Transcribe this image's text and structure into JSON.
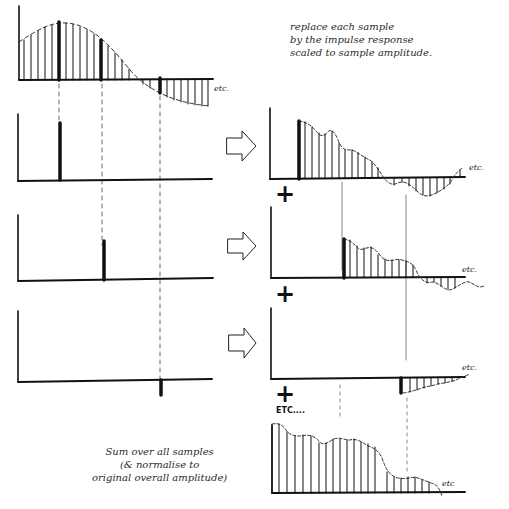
{
  "notes": {
    "top": [
      "replace each sample",
      "by the impulse response",
      "scaled to sample amplitude."
    ],
    "bottom": [
      "Sum over all samples",
      "(& normalise to",
      "original overall amplitude)"
    ]
  },
  "labels": {
    "etc": "etc.",
    "etc_sum": "etc",
    "etc_more": "ETC....",
    "plus": "+"
  },
  "panels": [
    {
      "id": "input-signal",
      "description": "sampled sine-like input waveform with three highlighted samples"
    },
    {
      "id": "sample-1",
      "description": "isolated first highlighted sample (positive, large)"
    },
    {
      "id": "sample-2",
      "description": "isolated second highlighted sample (positive, medium)"
    },
    {
      "id": "sample-3",
      "description": "isolated third highlighted sample (negative, small)"
    },
    {
      "id": "response-1",
      "description": "impulse response scaled to sample 1"
    },
    {
      "id": "response-2",
      "description": "impulse response scaled to sample 2"
    },
    {
      "id": "response-3",
      "description": "impulse response scaled to sample 3 (inverted)"
    },
    {
      "id": "sum-output",
      "description": "sum over all scaled impulse responses"
    }
  ],
  "arrows": 3,
  "colors": {
    "ink": "#111111",
    "paper": "#ffffff",
    "dash": "#333333"
  }
}
